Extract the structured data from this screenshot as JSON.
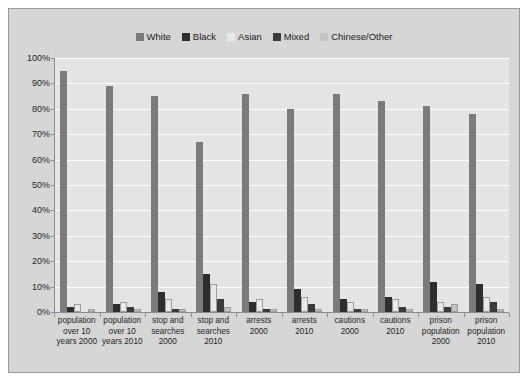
{
  "chart_data": {
    "type": "bar",
    "title": "",
    "xlabel": "",
    "ylabel": "",
    "ylim": [
      0,
      100
    ],
    "grid": true,
    "legend_position": "top-center",
    "ytick_labels": [
      "100%",
      "90%",
      "80%",
      "70%",
      "60%",
      "50%",
      "40%",
      "30%",
      "20%",
      "10%",
      "0%"
    ],
    "ytick_values": [
      100,
      90,
      80,
      70,
      60,
      50,
      40,
      30,
      20,
      10,
      0
    ],
    "categories": [
      "population over 10 years 2000",
      "population over 10 years 2010",
      "stop and searches 2000",
      "stop and searches 2010",
      "arrests 2000",
      "arrests 2010",
      "cautions 2000",
      "cautions 2010",
      "prison population 2000",
      "prison population 2010"
    ],
    "series": [
      {
        "name": "White",
        "color": "#7b7b7b",
        "values": [
          95,
          89,
          85,
          67,
          86,
          80,
          86,
          83,
          81,
          78
        ]
      },
      {
        "name": "Black",
        "color": "#2e2e2e",
        "values": [
          2,
          3,
          8,
          15,
          4,
          9,
          5,
          6,
          12,
          11
        ]
      },
      {
        "name": "Asian",
        "color": "#e8e8e8",
        "values": [
          3,
          4,
          5,
          11,
          5,
          6,
          4,
          5,
          4,
          6
        ]
      },
      {
        "name": "Mixed",
        "color": "#3a3a3a",
        "values": [
          0,
          2,
          1,
          5,
          1,
          3,
          1,
          2,
          2,
          4
        ]
      },
      {
        "name": "Chinese/Other",
        "color": "#c4c4c4",
        "values": [
          1,
          1,
          1,
          2,
          1,
          1,
          1,
          1,
          3,
          1
        ]
      }
    ]
  },
  "legend": {
    "items": [
      {
        "label": "White",
        "color": "#7b7b7b"
      },
      {
        "label": "Black",
        "color": "#2e2e2e"
      },
      {
        "label": "Asian",
        "color": "#e8e8e8"
      },
      {
        "label": "Mixed",
        "color": "#3a3a3a"
      },
      {
        "label": "Chinese/Other",
        "color": "#c4c4c4"
      }
    ]
  }
}
